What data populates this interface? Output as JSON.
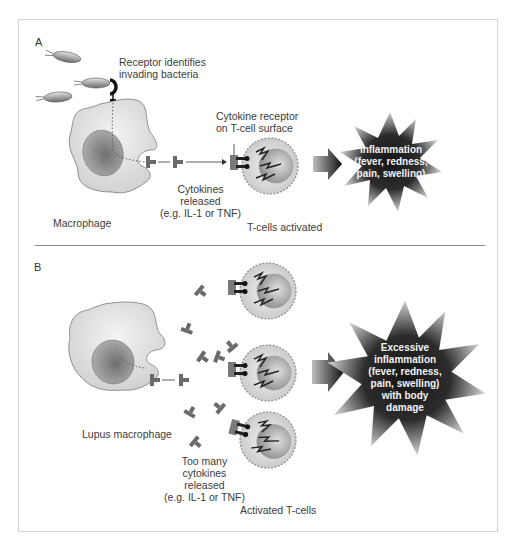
{
  "figure": {
    "panel_a": {
      "letter": "A",
      "receptor_label": "Receptor identifies\ninvading bacteria",
      "cytokine_receptor_label": "Cytokine receptor\non T-cell surface",
      "cytokines_label": "Cytokines\nreleased\n(e.g. IL-1 or TNF)",
      "macrophage_label": "Macrophage",
      "tcells_label": "T-cells activated",
      "outcome_label": "Inflammation\n(fever, redness,\npain, swelling)"
    },
    "panel_b": {
      "letter": "B",
      "macrophage_label": "Lupus macrophage",
      "cytokines_label": "Too many\ncytokines\nreleased\n(e.g. IL-1 or TNF)",
      "tcells_label": "Activated T-cells",
      "outcome_label": "Excessive\ninflammation\n(fever, redness,\npain, swelling)\nwith body\ndamage"
    },
    "colors": {
      "cell_fill": "#dcdcdc",
      "nucleus": "#8c8c8c",
      "burst": "#2a2a2a",
      "frame": "#d4d4d4",
      "divider": "#8a8a8a"
    }
  }
}
